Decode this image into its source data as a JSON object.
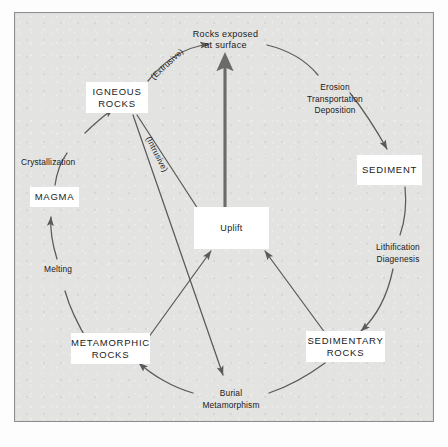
{
  "diagram": {
    "background_color": "#e3e3e1",
    "frame_color": "#8b8d8f",
    "ink_color": "#1a1a1a",
    "arrow_color": "#5a5a5a",
    "nodes": [
      {
        "id": "rocks-exposed",
        "label": "Rocks exposed\nat surface",
        "kind": "process-text"
      },
      {
        "id": "igneous-rocks",
        "label": "IGNEOUS\nROCKS",
        "kind": "rock-box"
      },
      {
        "id": "sediment",
        "label": "SEDIMENT",
        "kind": "rock-box"
      },
      {
        "id": "sedimentary-rocks",
        "label": "SEDIMENTARY\nROCKS",
        "kind": "rock-box"
      },
      {
        "id": "metamorphic-rocks",
        "label": "METAMORPHIC\nROCKS",
        "kind": "rock-box"
      },
      {
        "id": "magma",
        "label": "MAGMA",
        "kind": "rock-box"
      },
      {
        "id": "uplift",
        "label": "Uplift",
        "kind": "process-box"
      }
    ],
    "process_labels": [
      {
        "id": "erosion-transport",
        "label": "Erosion\nTransportation\nDeposition"
      },
      {
        "id": "lithification",
        "label": "Lithification\nDiagenesis"
      },
      {
        "id": "burial-metamorphism",
        "label": "Burial\nMetamorphism"
      },
      {
        "id": "melting",
        "label": "Melting"
      },
      {
        "id": "crystallization",
        "label": "Crystallization"
      },
      {
        "id": "extrusive",
        "label": "(Extrusive)"
      },
      {
        "id": "intrusive",
        "label": "(Intrusive)"
      }
    ],
    "edges": [
      {
        "from": "rocks-exposed",
        "to": "sediment",
        "via": "erosion-transport"
      },
      {
        "from": "sediment",
        "to": "sedimentary-rocks",
        "via": "lithification"
      },
      {
        "from": "sedimentary-rocks",
        "to": "burial-metamorphism",
        "via": ""
      },
      {
        "from": "burial-metamorphism",
        "to": "metamorphic-rocks",
        "via": ""
      },
      {
        "from": "metamorphic-rocks",
        "to": "magma",
        "via": "melting"
      },
      {
        "from": "magma",
        "to": "igneous-rocks",
        "via": "crystallization"
      },
      {
        "from": "igneous-rocks",
        "to": "rocks-exposed",
        "via": "extrusive"
      },
      {
        "from": "igneous-rocks",
        "to": "uplift",
        "via": "intrusive"
      },
      {
        "from": "igneous-rocks",
        "to": "burial-metamorphism",
        "via": ""
      },
      {
        "from": "metamorphic-rocks",
        "to": "uplift",
        "via": ""
      },
      {
        "from": "sedimentary-rocks",
        "to": "uplift",
        "via": ""
      },
      {
        "from": "uplift",
        "to": "rocks-exposed",
        "via": ""
      }
    ]
  }
}
